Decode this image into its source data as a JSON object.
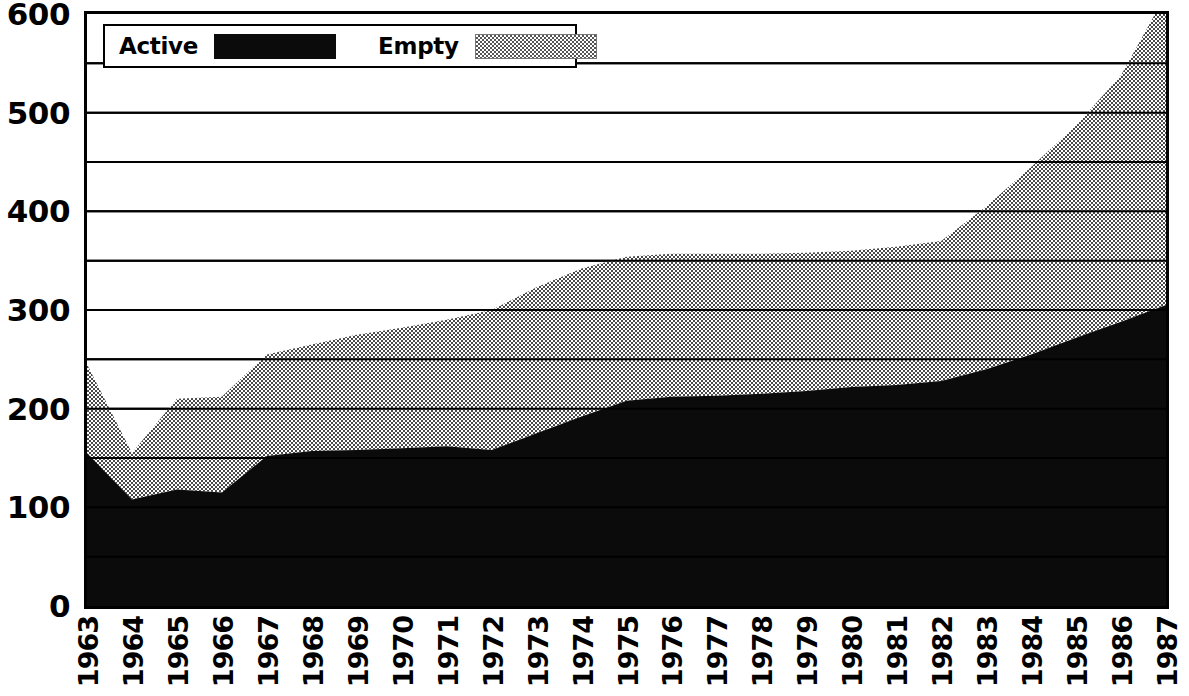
{
  "chart_data": {
    "type": "area",
    "stacked": true,
    "title": "",
    "subtitle": "",
    "xlabel": "",
    "ylabel": "",
    "categories": [
      "1963",
      "1964",
      "1965",
      "1966",
      "1967",
      "1968",
      "1969",
      "1970",
      "1971",
      "1972",
      "1973",
      "1974",
      "1975",
      "1976",
      "1977",
      "1978",
      "1979",
      "1980",
      "1981",
      "1982",
      "1983",
      "1984",
      "1985",
      "1986",
      "1987"
    ],
    "series": [
      {
        "name": "Active",
        "color": "#0b0b0b",
        "values": [
          155,
          108,
          118,
          115,
          152,
          157,
          158,
          160,
          162,
          158,
          175,
          192,
          208,
          212,
          213,
          215,
          218,
          222,
          224,
          228,
          240,
          255,
          272,
          288,
          305
        ]
      },
      {
        "name": "Empty",
        "color": "#9a9a9a",
        "values": [
          90,
          47,
          92,
          97,
          103,
          108,
          117,
          122,
          128,
          142,
          148,
          150,
          146,
          145,
          144,
          142,
          140,
          138,
          140,
          142,
          165,
          190,
          215,
          250,
          315
        ]
      }
    ],
    "totals": [
      245,
      155,
      210,
      212,
      255,
      265,
      275,
      282,
      290,
      300,
      323,
      342,
      354,
      357,
      357,
      357,
      358,
      360,
      364,
      370,
      405,
      445,
      487,
      538,
      620
    ],
    "ylim": [
      0,
      600
    ],
    "yticks": [
      0,
      100,
      200,
      300,
      400,
      500,
      600
    ],
    "gridlines": [
      0,
      50,
      100,
      150,
      200,
      250,
      300,
      350,
      400,
      450,
      500,
      550,
      600
    ],
    "grid": true,
    "grid_interval": 50,
    "legend_position": "top-left",
    "xtick_rotation": -90
  },
  "axes": {
    "y_tick_labels": [
      "600",
      "500",
      "400",
      "300",
      "200",
      "100",
      "0"
    ],
    "y_tick_values": [
      600,
      500,
      400,
      300,
      200,
      100,
      0
    ],
    "x_tick_labels": [
      "1963",
      "1964",
      "1965",
      "1966",
      "1967",
      "1968",
      "1969",
      "1970",
      "1971",
      "1972",
      "1973",
      "1974",
      "1975",
      "1976",
      "1977",
      "1978",
      "1979",
      "1980",
      "1981",
      "1982",
      "1983",
      "1984",
      "1985",
      "1986",
      "1987"
    ]
  },
  "legend": {
    "items": [
      {
        "label": "Active",
        "swatch": "solid-black-swatch",
        "color": "#0b0b0b"
      },
      {
        "label": "Empty",
        "swatch": "dotted-gray-swatch",
        "color": "#9a9a9a"
      }
    ]
  }
}
